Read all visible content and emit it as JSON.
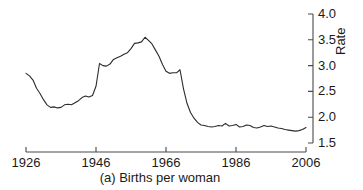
{
  "chart_data": {
    "type": "line",
    "title": "",
    "caption": "(a) Births per woman",
    "xlabel": "",
    "ylabel": "Rate",
    "xlim": [
      1926,
      2006
    ],
    "ylim": [
      1.5,
      4.0
    ],
    "xticks": [
      1926,
      1946,
      1966,
      1986,
      2006
    ],
    "xtick_labels": [
      "1926",
      "1946",
      "1966",
      "1986",
      "2006"
    ],
    "yticks": [
      1.5,
      2.0,
      2.5,
      3.0,
      3.5,
      4.0
    ],
    "ytick_labels": [
      "1.5",
      "2.0",
      "2.5",
      "3.0",
      "3.5",
      "4.0"
    ],
    "grid": false,
    "legend": false,
    "line_color": "#2b2b2b",
    "series": [
      {
        "name": "Births per woman",
        "x": [
          1926,
          1927,
          1928,
          1929,
          1930,
          1931,
          1932,
          1933,
          1934,
          1935,
          1936,
          1937,
          1938,
          1939,
          1940,
          1941,
          1942,
          1943,
          1944,
          1945,
          1946,
          1947,
          1948,
          1949,
          1950,
          1951,
          1952,
          1953,
          1954,
          1955,
          1956,
          1957,
          1958,
          1959,
          1960,
          1961,
          1962,
          1963,
          1964,
          1965,
          1966,
          1967,
          1968,
          1969,
          1970,
          1971,
          1972,
          1973,
          1974,
          1975,
          1976,
          1977,
          1978,
          1979,
          1980,
          1981,
          1982,
          1983,
          1984,
          1985,
          1986,
          1987,
          1988,
          1989,
          1990,
          1991,
          1992,
          1993,
          1994,
          1995,
          1996,
          1997,
          1998,
          1999,
          2000,
          2001,
          2002,
          2003,
          2004,
          2005,
          2006
        ],
        "y": [
          2.85,
          2.8,
          2.72,
          2.56,
          2.46,
          2.34,
          2.24,
          2.19,
          2.2,
          2.18,
          2.19,
          2.24,
          2.25,
          2.24,
          2.28,
          2.32,
          2.38,
          2.41,
          2.39,
          2.42,
          2.6,
          3.04,
          3.0,
          2.99,
          3.03,
          3.12,
          3.15,
          3.18,
          3.22,
          3.25,
          3.33,
          3.43,
          3.44,
          3.46,
          3.55,
          3.49,
          3.42,
          3.3,
          3.18,
          3.02,
          2.89,
          2.85,
          2.86,
          2.86,
          2.92,
          2.55,
          2.27,
          2.09,
          1.98,
          1.9,
          1.85,
          1.84,
          1.82,
          1.81,
          1.82,
          1.84,
          1.83,
          1.88,
          1.83,
          1.84,
          1.86,
          1.81,
          1.82,
          1.85,
          1.84,
          1.8,
          1.79,
          1.81,
          1.84,
          1.82,
          1.83,
          1.81,
          1.79,
          1.78,
          1.76,
          1.75,
          1.74,
          1.73,
          1.74,
          1.76,
          1.8
        ]
      }
    ]
  },
  "axes": {
    "x_ticks": [
      {
        "label": "1926",
        "value": 1926
      },
      {
        "label": "1946",
        "value": 1946
      },
      {
        "label": "1966",
        "value": 1966
      },
      {
        "label": "1986",
        "value": 1986
      },
      {
        "label": "2006",
        "value": 2006
      }
    ],
    "y_ticks": [
      {
        "label": "4.0",
        "value": 4.0
      },
      {
        "label": "3.5",
        "value": 3.5
      },
      {
        "label": "3.0",
        "value": 3.0
      },
      {
        "label": "2.5",
        "value": 2.5
      },
      {
        "label": "2.0",
        "value": 2.0
      },
      {
        "label": "1.5",
        "value": 1.5
      }
    ],
    "y_title": "Rate"
  },
  "caption": {
    "text": "(a) Births per woman"
  },
  "colors": {
    "line": "#2b2b2b",
    "axis": "#4a4a4a",
    "background": "#ffffff",
    "text": "#1a1a1a"
  }
}
